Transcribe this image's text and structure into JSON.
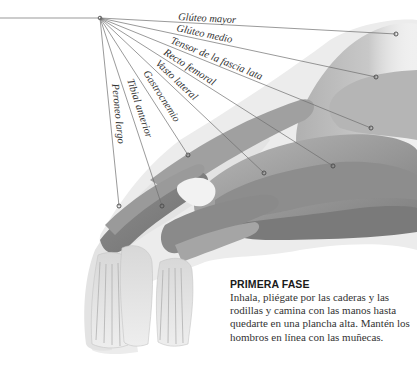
{
  "figure": {
    "origin": {
      "x": 100,
      "y": 18
    },
    "origin_line_start_x": 0,
    "labels": [
      {
        "text": "Glúteo mayor",
        "target": {
          "x": 396,
          "y": 34
        },
        "angle": 3.1,
        "label_pos": {
          "x": 178,
          "y": 20
        }
      },
      {
        "text": "Glúteo medio",
        "target": {
          "x": 376,
          "y": 77
        },
        "angle": 12.1,
        "label_pos": {
          "x": 176,
          "y": 31
        }
      },
      {
        "text": "Tensor de la fascia lata",
        "target": {
          "x": 371,
          "y": 128
        },
        "angle": 22.1,
        "label_pos": {
          "x": 170,
          "y": 43
        }
      },
      {
        "text": "Recto femoral",
        "target": {
          "x": 333,
          "y": 166
        },
        "angle": 32.4,
        "label_pos": {
          "x": 163,
          "y": 54
        }
      },
      {
        "text": "Vasto lateral",
        "target": {
          "x": 264,
          "y": 173
        },
        "angle": 43.4,
        "label_pos": {
          "x": 155,
          "y": 64
        }
      },
      {
        "text": "Gastrocnemio",
        "target": {
          "x": 188,
          "y": 155
        },
        "angle": 57.3,
        "label_pos": {
          "x": 143,
          "y": 73
        }
      },
      {
        "text": "Tibial anterior",
        "target": {
          "x": 162,
          "y": 206
        },
        "angle": 71.7,
        "label_pos": {
          "x": 127,
          "y": 80
        }
      },
      {
        "text": "Peroneo largo",
        "target": {
          "x": 119,
          "y": 206
        },
        "angle": 84.2,
        "label_pos": {
          "x": 112,
          "y": 84
        }
      }
    ],
    "colors": {
      "muscle_dark": "#8a8a8a",
      "muscle_mid": "#a8a8a8",
      "muscle_light": "#cfcfcf",
      "skin_halo": "#e6e6e6",
      "line": "#6e6e6e"
    }
  },
  "caption": {
    "title": "PRIMERA FASE",
    "body": "Inhala, pliégate por las caderas y las rodillas y camina con las manos hasta quedarte en una plancha alta. Mantén los hombros en línea con las muñecas."
  }
}
